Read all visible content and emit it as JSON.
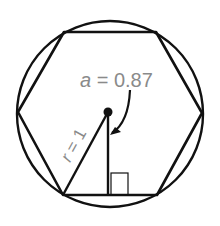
{
  "diagram": {
    "labels": {
      "apothem_var": "a",
      "apothem_eq": " = ",
      "apothem_value": "0.87",
      "radius_var": "r",
      "radius_eq": " = ",
      "radius_value": "1"
    },
    "colors": {
      "stroke": "#111111",
      "label": "#8a8a8a",
      "background": "#ffffff"
    },
    "geometry": {
      "circle": {
        "cx": 110,
        "cy": 114,
        "r": 93
      },
      "hexagon_vertices": [
        [
          64,
          32
        ],
        [
          156,
          32
        ],
        [
          202,
          113
        ],
        [
          157,
          195
        ],
        [
          63,
          195
        ],
        [
          18,
          112
        ]
      ],
      "center_point": [
        108,
        112
      ],
      "apothem_foot": [
        108,
        195
      ],
      "radius_end": [
        63,
        195
      ],
      "right_angle_box": {
        "x": 111,
        "y": 173,
        "w": 17,
        "h": 22
      }
    }
  }
}
